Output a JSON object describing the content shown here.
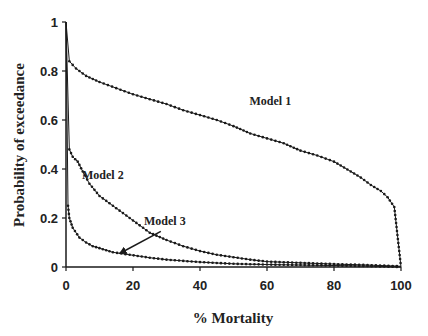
{
  "chart_data": {
    "type": "line",
    "title": "",
    "xlabel": "% Mortality",
    "ylabel": "Probability of exceedance",
    "xlim": [
      0,
      100
    ],
    "ylim": [
      0,
      1
    ],
    "x_ticks": [
      0,
      20,
      40,
      60,
      80,
      100
    ],
    "y_ticks": [
      0,
      0.2,
      0.4,
      0.6,
      0.8,
      1
    ],
    "x_tick_labels": [
      "0",
      "20",
      "40",
      "60",
      "80",
      "100"
    ],
    "y_tick_labels": [
      "0",
      "0.2",
      "0.4",
      "0.6",
      "0.8",
      "1"
    ],
    "grid": false,
    "legend": "none (inline annotations)",
    "series": [
      {
        "name": "Model 1",
        "x": [
          0,
          1,
          3,
          6,
          10,
          15,
          20,
          25,
          30,
          35,
          40,
          45,
          50,
          55,
          60,
          65,
          70,
          75,
          80,
          85,
          88,
          91,
          94,
          96,
          98,
          100
        ],
        "y": [
          1.0,
          0.84,
          0.81,
          0.78,
          0.755,
          0.73,
          0.705,
          0.685,
          0.665,
          0.64,
          0.62,
          0.6,
          0.575,
          0.545,
          0.525,
          0.505,
          0.475,
          0.455,
          0.43,
          0.39,
          0.365,
          0.335,
          0.31,
          0.285,
          0.245,
          0.0
        ]
      },
      {
        "name": "Model 2",
        "x": [
          0,
          1,
          2,
          3.5,
          5,
          7,
          10,
          13,
          16,
          20,
          25,
          30,
          35,
          40,
          45,
          50,
          55,
          60,
          70,
          80,
          90,
          100
        ],
        "y": [
          1.0,
          0.48,
          0.45,
          0.43,
          0.39,
          0.34,
          0.29,
          0.26,
          0.23,
          0.19,
          0.14,
          0.11,
          0.085,
          0.065,
          0.05,
          0.04,
          0.03,
          0.022,
          0.017,
          0.012,
          0.008,
          0.003
        ]
      },
      {
        "name": "Model 3",
        "x": [
          0,
          0.6,
          1,
          2,
          4,
          6,
          8,
          10,
          14,
          19,
          25,
          30,
          40,
          50,
          60,
          70,
          80,
          90,
          100
        ],
        "y": [
          1.0,
          0.25,
          0.2,
          0.16,
          0.12,
          0.1,
          0.085,
          0.077,
          0.06,
          0.05,
          0.038,
          0.03,
          0.02,
          0.013,
          0.01,
          0.008,
          0.006,
          0.004,
          0.0
        ]
      }
    ],
    "annotations": [
      {
        "text": "Model 1",
        "x": 61,
        "y": 0.66
      },
      {
        "text": "Model 2",
        "x": 11,
        "y": 0.36
      },
      {
        "text": "Model 3",
        "x": 29.5,
        "y": 0.17,
        "arrow_to": {
          "x": 16,
          "y": 0.055
        }
      }
    ]
  },
  "layout": {
    "plot_px": {
      "x0": 66,
      "x1": 401,
      "y0": 267,
      "y1": 22
    },
    "line_color": "#1a1a1a"
  }
}
